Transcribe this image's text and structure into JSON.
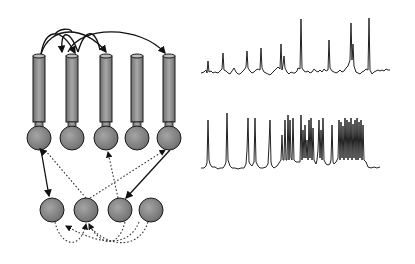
{
  "diagram": {
    "pyramidal_cells": [
      {
        "id": "p1",
        "cx": 39
      },
      {
        "id": "p2",
        "cx": 72
      },
      {
        "id": "p3",
        "cx": 106
      },
      {
        "id": "p4",
        "cx": 137
      },
      {
        "id": "p5",
        "cx": 169
      }
    ],
    "interneurons": [
      {
        "id": "i1",
        "cx": 52
      },
      {
        "id": "i2",
        "cx": 86
      },
      {
        "id": "i3",
        "cx": 120
      },
      {
        "id": "i4",
        "cx": 151
      }
    ],
    "colors": {
      "cell_fill": "#8a8a8a",
      "cell_stroke": "#1a1a1a",
      "trace": "#222222",
      "background": "#ffffff"
    },
    "traces": [
      {
        "id": "trace-top",
        "label": "sparse firing trace"
      },
      {
        "id": "trace-bottom",
        "label": "burst firing trace"
      }
    ]
  }
}
